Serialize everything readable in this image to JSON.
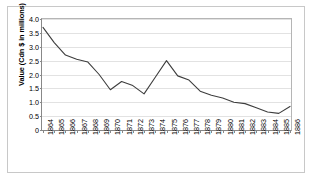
{
  "chart_data": {
    "type": "line",
    "title": "",
    "xlabel": "",
    "ylabel": "Value (Cdn $ in millions)",
    "ylim": [
      0,
      4.0
    ],
    "yticks": [
      "0",
      "0.5",
      "1.0",
      "1.5",
      "2.0",
      "2.5",
      "3.0",
      "3.5",
      "4.0"
    ],
    "ytick_values": [
      0,
      0.5,
      1.0,
      1.5,
      2.0,
      2.5,
      3.0,
      3.5,
      4.0
    ],
    "grid": true,
    "legend": "none",
    "categories": [
      "1864",
      "1865",
      "1866",
      "1867",
      "1868",
      "1869",
      "1870",
      "1871",
      "1872",
      "1873",
      "1874",
      "1875",
      "1876",
      "1877",
      "1878",
      "1879",
      "1880",
      "1881",
      "1882",
      "1883",
      "1884",
      "1885",
      "1886"
    ],
    "values": [
      3.7,
      3.15,
      2.7,
      2.55,
      2.45,
      2.0,
      1.45,
      1.75,
      1.6,
      1.3,
      1.9,
      2.5,
      1.95,
      1.8,
      1.4,
      1.25,
      1.15,
      1.0,
      0.95,
      0.8,
      0.65,
      0.6,
      0.85
    ],
    "series_color": "#3d3d3d",
    "grid_color": "#e2e2e2",
    "axis_color": "#888888"
  }
}
